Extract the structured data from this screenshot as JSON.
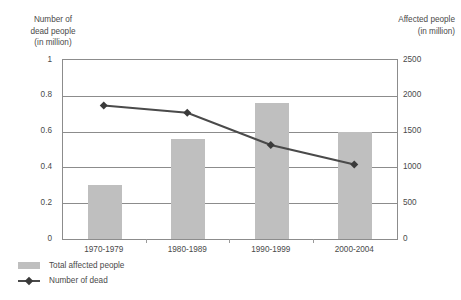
{
  "chart_data": {
    "type": "bar",
    "title": "",
    "categories": [
      "1970-1979",
      "1980-1989",
      "1990-1999",
      "2000-2004"
    ],
    "series": [
      {
        "name": "Total affected people",
        "type": "bar",
        "axis": "right",
        "unit": "million",
        "values": [
          750,
          1400,
          1900,
          1500
        ],
        "color": "#bfbfbf"
      },
      {
        "name": "Number of dead",
        "type": "line",
        "axis": "left",
        "unit": "million",
        "values": [
          0.74,
          0.7,
          0.52,
          0.41
        ],
        "color": "#4a4a4a"
      }
    ],
    "left_axis": {
      "title": "Number of\ndead people\n(in million)",
      "title_line1": "Number of",
      "title_line2": "dead people",
      "title_line3": "(in million)",
      "ticks": [
        "1",
        "0.8",
        "0.6",
        "0.4",
        "0.2",
        "0"
      ],
      "values": [
        1,
        0.8,
        0.6,
        0.4,
        0.2,
        0
      ],
      "min": 0,
      "max": 1
    },
    "right_axis": {
      "title_line1": "Affected people",
      "title_line2": "(in million)",
      "ticks": [
        "2500",
        "2000",
        "1500",
        "1000",
        "500",
        "0"
      ],
      "values": [
        2500,
        2000,
        1500,
        1000,
        500,
        0
      ],
      "min": 0,
      "max": 2500
    },
    "xlabel": "",
    "grid": true,
    "legend_position": "bottom-left",
    "legend": [
      {
        "label": "Total affected people",
        "marker": "bar-swatch"
      },
      {
        "label": "Number of dead",
        "marker": "line-diamond"
      }
    ]
  }
}
